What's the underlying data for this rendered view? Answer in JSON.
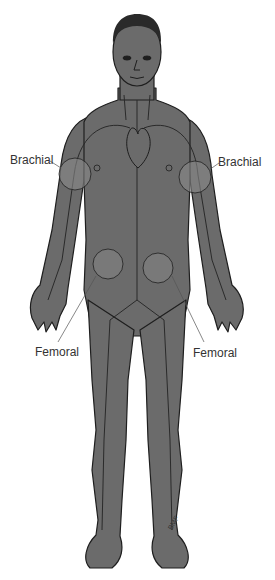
{
  "figure": {
    "skin_color": "#6b6b6b",
    "outline_color": "#1e1e1e",
    "circle_fill": "#808080",
    "signature": "BMF 97"
  },
  "labels": {
    "brachial_left": "Brachial",
    "brachial_right": "Brachial",
    "femoral_left": "Femoral",
    "femoral_right": "Femoral"
  }
}
